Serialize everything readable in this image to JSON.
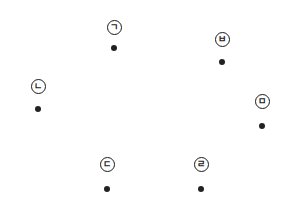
{
  "diagram": {
    "points": [
      {
        "id": "giyeok",
        "label": "ㄱ",
        "label_x": 114,
        "label_y": 27,
        "dot_offset": 21
      },
      {
        "id": "nieun",
        "label": "ㄴ",
        "label_x": 38,
        "label_y": 86,
        "dot_offset": 23
      },
      {
        "id": "digeut",
        "label": "ㄷ",
        "label_x": 107,
        "label_y": 164,
        "dot_offset": 25
      },
      {
        "id": "rieul",
        "label": "ㄹ",
        "label_x": 201,
        "label_y": 164,
        "dot_offset": 25
      },
      {
        "id": "mieum",
        "label": "ㅁ",
        "label_x": 262,
        "label_y": 101,
        "dot_offset": 25
      },
      {
        "id": "bieup",
        "label": "ㅂ",
        "label_x": 222,
        "label_y": 39,
        "dot_offset": 23
      }
    ],
    "colors": {
      "stroke": "#1a1a1a",
      "dot": "#222222",
      "background": "#ffffff"
    }
  }
}
